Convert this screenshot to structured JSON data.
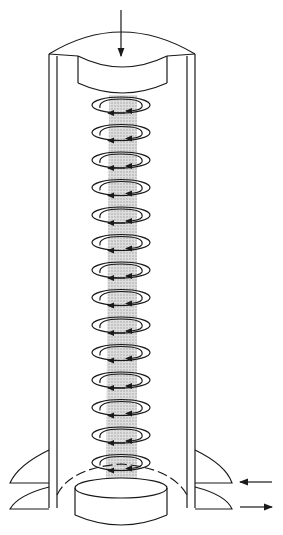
{
  "diagram": {
    "type": "vortex-tube-schematic",
    "colors": {
      "stroke": "#1a1a1a",
      "core": "#c8c8c8",
      "background": "#ffffff"
    },
    "arrows": {
      "top_inflow": "downward-arrow",
      "side_inflow": "left-arrow",
      "side_outflow": "right-arrow"
    },
    "vortex_ring_count": 14,
    "labels": []
  }
}
